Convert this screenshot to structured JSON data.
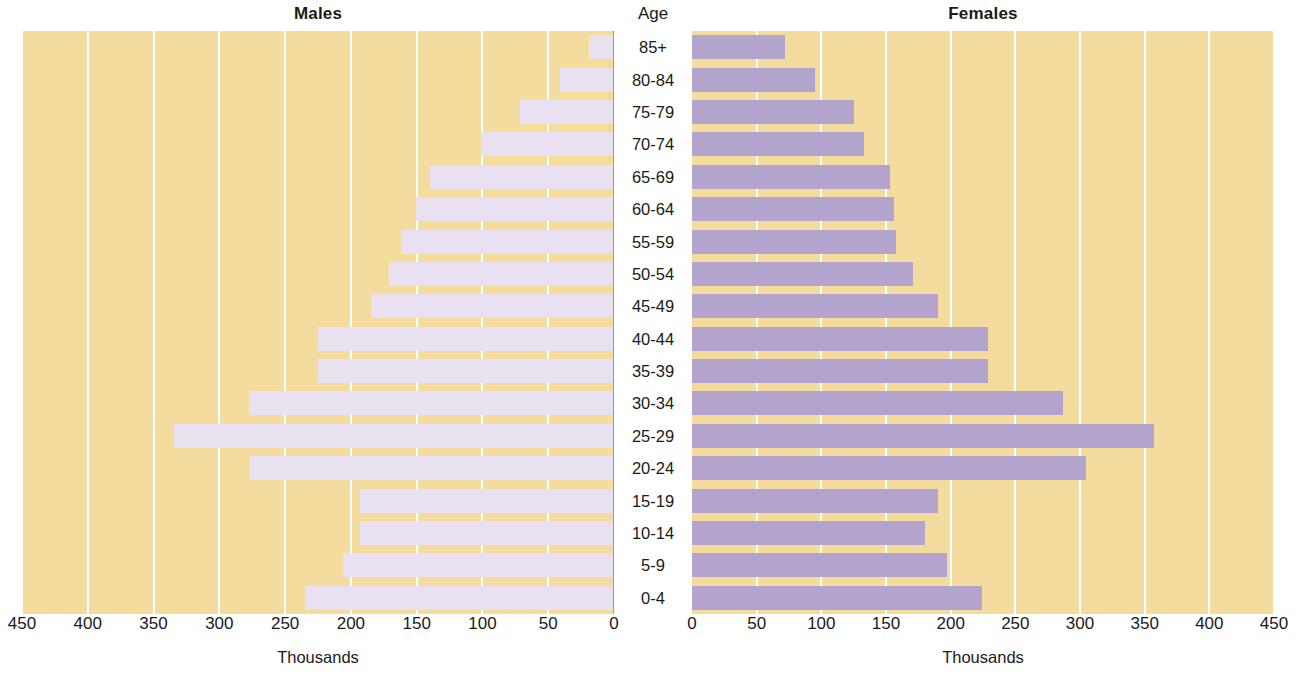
{
  "titles": {
    "males": "Males",
    "females": "Females",
    "age": "Age"
  },
  "axis_title": "Thousands",
  "colors": {
    "panel_background": "#f3dc9e",
    "male_bar": "#e9e1ef",
    "female_bar": "#b3a4cd",
    "gridline": "#ffffff",
    "text": "#1a1a1a"
  },
  "chart_data": {
    "type": "bar",
    "subtype": "population-pyramid",
    "title": "",
    "xlabel": "Thousands",
    "ylabel": "Age",
    "xlim_left": [
      450,
      0
    ],
    "xlim_right": [
      0,
      450
    ],
    "ticks": [
      0,
      50,
      100,
      150,
      200,
      250,
      300,
      350,
      400,
      450
    ],
    "left_ticks": [
      450,
      400,
      350,
      300,
      250,
      200,
      150,
      100,
      50,
      0
    ],
    "right_ticks": [
      0,
      50,
      100,
      150,
      200,
      250,
      300,
      350,
      400,
      450
    ],
    "grid": true,
    "legend": "none",
    "categories": [
      "85+",
      "80-84",
      "75-79",
      "70-74",
      "65-69",
      "60-64",
      "55-59",
      "50-54",
      "45-49",
      "40-44",
      "35-39",
      "30-34",
      "25-29",
      "20-24",
      "15-19",
      "10-14",
      "5-9",
      "0-4"
    ],
    "series": [
      {
        "name": "Males",
        "side": "left",
        "values": [
          18,
          40,
          71,
          100,
          139,
          150,
          161,
          170,
          184,
          224,
          224,
          277,
          334,
          276,
          192,
          192,
          205,
          234
        ]
      },
      {
        "name": "Females",
        "side": "right",
        "values": [
          72,
          95,
          125,
          133,
          153,
          156,
          158,
          171,
          190,
          229,
          229,
          287,
          357,
          305,
          190,
          180,
          197,
          224
        ]
      }
    ]
  }
}
